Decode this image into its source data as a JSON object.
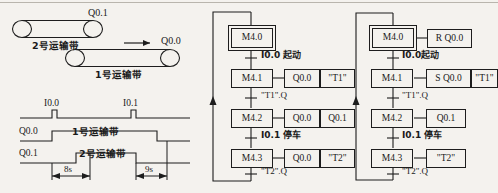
{
  "figure": {
    "background": "#f4f2ee",
    "ink": "#1d1d1d",
    "width": 498,
    "height": 193
  },
  "conveyor_diagram": {
    "belt2_label": "2号运输带",
    "belt2_motor": "Q0.1",
    "belt1_label": "1号运输带",
    "belt1_motor": "Q0.0",
    "direction_arrow": "arrow-right-icon"
  },
  "timing_diagram": {
    "signals": [
      {
        "name": "I0.0",
        "type": "pulse"
      },
      {
        "name": "I0.1",
        "type": "pulse"
      },
      {
        "name": "Q0.0",
        "label": "1号运输带"
      },
      {
        "name": "Q0.1",
        "label": "2号运输带"
      }
    ],
    "intervals": [
      {
        "label": "8s"
      },
      {
        "label": "9s"
      }
    ]
  },
  "chart_left": {
    "title": "",
    "steps": [
      {
        "step": "M4.0",
        "initial": true,
        "actions": []
      },
      {
        "step": "M4.1",
        "initial": false,
        "actions": [
          "Q0.0",
          "\"T1\""
        ]
      },
      {
        "step": "M4.2",
        "initial": false,
        "actions": [
          "Q0.0",
          "Q0.1"
        ]
      },
      {
        "step": "M4.3",
        "initial": false,
        "actions": [
          "Q0.0",
          "\"T2\""
        ]
      }
    ],
    "transitions": [
      "I0.0 起动",
      "\"T1\".Q",
      "I0.1 停车",
      "\"T2\".Q"
    ]
  },
  "chart_right": {
    "title": "",
    "steps": [
      {
        "step": "M4.0",
        "initial": true,
        "actions": [
          "R Q0.0"
        ]
      },
      {
        "step": "M4.1",
        "initial": false,
        "actions": [
          "S Q0.0",
          "\"T1\""
        ]
      },
      {
        "step": "M4.2",
        "initial": false,
        "actions": [
          "Q0.1"
        ]
      },
      {
        "step": "M4.3",
        "initial": false,
        "actions": [
          "\"T2\""
        ]
      }
    ],
    "transitions": [
      "I0.0起动",
      "\"T1\".Q",
      "I0.1 停车",
      "\"T2\".Q"
    ]
  }
}
